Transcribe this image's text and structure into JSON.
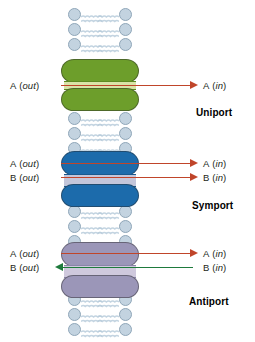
{
  "figure": {
    "background_color": "#ffffff"
  },
  "membrane": {
    "lipid_head_color": "#c3d3e0",
    "lipid_head_stroke": "#8fa6b8",
    "lipid_tail_color": "#b9cddc",
    "head_label": "phospholipid-head",
    "tail_label": "phospholipid-tail"
  },
  "colors": {
    "protein_green": "#6d9e2b",
    "protein_green_dark": "#5d8a22",
    "protein_blue": "#1c6bab",
    "protein_blue_dark": "#17598f",
    "protein_purple": "#9b96b8",
    "protein_purple_dark": "#8a85a8",
    "channel_green": "#d9e3a8",
    "channel_blue": "#c3c6da",
    "channel_purple": "#cfc9dd",
    "arrow_red": "#c0452a",
    "arrow_green": "#1e7a3c",
    "text": "#231f20"
  },
  "panels": [
    {
      "id": "uniport",
      "mode_label": "Uniport",
      "protein_color": "#6d9e2b",
      "channel_color": "#d9e3a8",
      "arrows": [
        {
          "substrate": "A",
          "left_label": "A (out)",
          "left_species": "A",
          "left_state": "out",
          "right_label": "A (in)",
          "right_species": "A",
          "right_state": "in",
          "direction": "right",
          "color": "#c0452a"
        }
      ]
    },
    {
      "id": "symport",
      "mode_label": "Symport",
      "protein_color": "#1c6bab",
      "channel_color": "#c3c6da",
      "arrows": [
        {
          "substrate": "A",
          "left_label": "A (out)",
          "left_species": "A",
          "left_state": "out",
          "right_label": "A (in)",
          "right_species": "A",
          "right_state": "in",
          "direction": "right",
          "color": "#c0452a"
        },
        {
          "substrate": "B",
          "left_label": "B (out)",
          "left_species": "B",
          "left_state": "out",
          "right_label": "B (in)",
          "right_species": "B",
          "right_state": "in",
          "direction": "right",
          "color": "#c0452a"
        }
      ]
    },
    {
      "id": "antiport",
      "mode_label": "Antiport",
      "protein_color": "#9b96b8",
      "channel_color": "#cfc9dd",
      "arrows": [
        {
          "substrate": "A",
          "left_label": "A (out)",
          "left_species": "A",
          "left_state": "out",
          "right_label": "A (in)",
          "right_species": "A",
          "right_state": "in",
          "direction": "right",
          "color": "#c0452a"
        },
        {
          "substrate": "B",
          "left_label": "B (out)",
          "left_species": "B",
          "left_state": "out",
          "right_label": "B (in)",
          "right_species": "B",
          "right_state": "in",
          "direction": "left",
          "color": "#1e7a3c"
        }
      ]
    }
  ]
}
